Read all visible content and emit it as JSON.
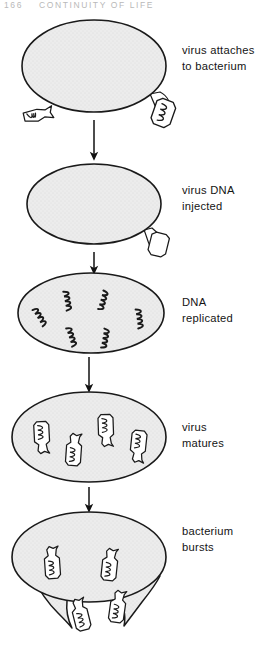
{
  "page": {
    "running_head": {
      "folio": "166",
      "title": "CONTINUITY OF LIFE"
    },
    "figure_title": "Lytic cycle of a bacteriophage virus infecting a bacterium"
  },
  "colors": {
    "cell_fill": "#e9e9e9",
    "cell_stroke": "#1a1a1a",
    "virus_fill": "#ffffff",
    "virus_stroke": "#1a1a1a",
    "arrow": "#111111",
    "text": "#141414",
    "running_head_text": "#b9b9b9",
    "page_background": "#ffffff"
  },
  "stages": [
    {
      "id": "stage-1",
      "label": "virus attaches\nto bacterium",
      "label_lines": [
        "virus attaches",
        "to bacterium"
      ],
      "cell": {
        "cx": 94,
        "cy": 66,
        "rx": 72,
        "ry": 46
      },
      "viruses_attached": 1,
      "viruses_free": 1,
      "dna_strands_inside": 0
    },
    {
      "id": "stage-2",
      "label": "virus DNA\ninjected",
      "label_lines": [
        "virus DNA",
        "injected"
      ],
      "cell": {
        "cx": 94,
        "cy": 204,
        "rx": 67,
        "ry": 40
      },
      "viruses_attached": 1,
      "viruses_free": 0,
      "dna_strands_inside": 0
    },
    {
      "id": "stage-3",
      "label": "DNA\nreplicated",
      "label_lines": [
        "DNA",
        "replicated"
      ],
      "cell": {
        "cx": 91,
        "cy": 313,
        "rx": 73,
        "ry": 40
      },
      "viruses_attached": 0,
      "viruses_free": 0,
      "dna_strands_inside": 6
    },
    {
      "id": "stage-4",
      "label": "virus\nmatures",
      "label_lines": [
        "virus",
        "matures"
      ],
      "cell": {
        "cx": 89,
        "cy": 437,
        "rx": 77,
        "ry": 45
      },
      "viruses_attached": 0,
      "viruses_free": 0,
      "matured_viruses_inside": 4
    },
    {
      "id": "stage-5",
      "label": "bacterium\nbursts",
      "label_lines": [
        "bacterium",
        "bursts"
      ],
      "cell": {
        "cx": 89,
        "cy": 557,
        "rx": 77,
        "ry": 45
      },
      "viruses_inside": 2,
      "viruses_escaping": 2,
      "burst": true
    }
  ],
  "arrows": [
    {
      "from_stage": "stage-1",
      "to_stage": "stage-2",
      "x": 94,
      "y_start": 120,
      "y_end": 158
    },
    {
      "from_stage": "stage-2",
      "to_stage": "stage-3",
      "x": 94,
      "y_start": 250,
      "y_end": 272
    },
    {
      "from_stage": "stage-3",
      "to_stage": "stage-4",
      "x": 89,
      "y_start": 357,
      "y_end": 390
    },
    {
      "from_stage": "stage-4",
      "to_stage": "stage-5",
      "x": 89,
      "y_start": 487,
      "y_end": 510
    }
  ]
}
